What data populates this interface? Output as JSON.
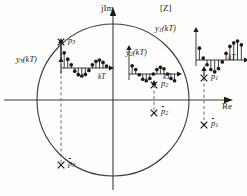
{
  "figure": {
    "title_plane": "[Z]",
    "axes": {
      "imaginary_label": "jIm",
      "real_label": "Re",
      "origin": [
        113,
        100
      ],
      "unit_circle": {
        "cx": 113,
        "cy": 100,
        "r": 76
      }
    },
    "signal_time_axis_label": "kT",
    "signals": [
      {
        "id": "y1",
        "label": "y",
        "label_sub": "1",
        "label_arg": "(kT)",
        "full_label": "y1(kT)",
        "behavior": "growing-oscillation",
        "pole": "p1",
        "origin": [
          196,
          60
        ],
        "axis_len": 48,
        "time_label": "kT",
        "samples": [
          0.62,
          0.1,
          -0.25,
          -0.5,
          -0.62,
          -0.45,
          -0.1,
          0.35,
          0.72,
          0.9,
          1.0,
          0.8
        ]
      },
      {
        "id": "y2",
        "label": "y",
        "label_sub": "2",
        "label_arg": "(kT)",
        "full_label": "y2(kT)",
        "behavior": "sustained-oscillation",
        "pole": "p2",
        "origin": [
          129,
          74
        ],
        "axis_len": 48,
        "time_label": "kT",
        "samples": [
          0.55,
          0.3,
          -0.05,
          -0.35,
          -0.45,
          -0.3,
          0.0,
          0.3,
          0.45,
          0.35,
          0.0,
          -0.3,
          -0.45
        ]
      },
      {
        "id": "y3",
        "label": "y",
        "label_sub": "3",
        "label_arg": "(kT)",
        "full_label": "y3(kT)",
        "behavior": "damped-oscillation",
        "pole": "p3",
        "origin": [
          61,
          68
        ],
        "axis_len": 48,
        "time_label": "kT",
        "samples": [
          0.95,
          0.55,
          0.2,
          -0.2,
          -0.42,
          -0.5,
          -0.4,
          -0.15,
          0.2,
          0.42,
          0.5,
          0.35,
          0.12
        ]
      }
    ],
    "poles": [
      {
        "id": "p1",
        "label": "p",
        "sub": "1",
        "conjugate": false,
        "x": 204,
        "y": 78,
        "marker": "x"
      },
      {
        "id": "p1b",
        "label": "p",
        "sub": "1",
        "conjugate": true,
        "x": 204,
        "y": 125,
        "marker": "x"
      },
      {
        "id": "p2",
        "label": "p",
        "sub": "2",
        "conjugate": false,
        "x": 154,
        "y": 85,
        "marker": "x"
      },
      {
        "id": "p2b",
        "label": "p",
        "sub": "2",
        "conjugate": true,
        "x": 154,
        "y": 113,
        "marker": "x"
      },
      {
        "id": "p3",
        "label": "p",
        "sub": "3",
        "conjugate": false,
        "x": 61,
        "y": 42,
        "marker": "x"
      },
      {
        "id": "p3b",
        "label": "p",
        "sub": "3",
        "conjugate": true,
        "x": 61,
        "y": 165,
        "marker": "x"
      }
    ],
    "pole_labels": {
      "p1": "p1",
      "p1_conj": "p̄1",
      "p2": "p2",
      "p2_conj": "p̄2",
      "p3": "p3",
      "p3_conj": "p̄3"
    },
    "colors": {
      "ink": "#1a1a1a",
      "line": "#3a3a3a",
      "dash": "#6a6a6a",
      "background": "#fdfdfc"
    }
  }
}
